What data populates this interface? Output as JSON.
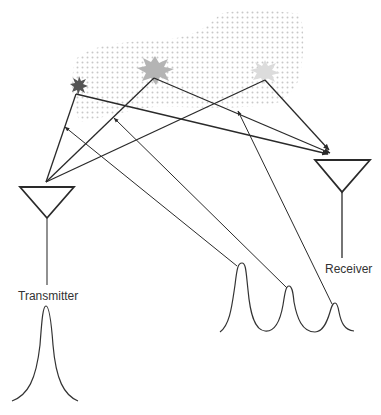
{
  "diagram": {
    "type": "multipath radar propagation",
    "labels": {
      "transmitter": "Transmitter",
      "receiver": "Receiver"
    },
    "colors": {
      "line": "#2a2a2a",
      "cloud_dots": "#c8c8c8",
      "scatterer_dark": "#555555",
      "scatterer_mid": "#b4b4b4",
      "scatterer_light": "#dcdcdc"
    },
    "scatterers": [
      {
        "name": "scatterer-near",
        "shade": "dark"
      },
      {
        "name": "scatterer-middle",
        "shade": "mid"
      },
      {
        "name": "scatterer-far",
        "shade": "light"
      }
    ],
    "received_pulses": [
      {
        "name": "echo-1",
        "relative_amplitude": "large"
      },
      {
        "name": "echo-2",
        "relative_amplitude": "medium"
      },
      {
        "name": "echo-3",
        "relative_amplitude": "small"
      }
    ],
    "transmitted_pulse": {
      "name": "transmitted-pulse"
    }
  }
}
